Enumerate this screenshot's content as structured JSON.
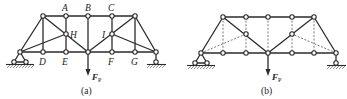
{
  "figures": [
    {
      "id": "a",
      "caption": "(a)",
      "load_label": "F",
      "load_subscript": "P",
      "joint_labels": {
        "A": "A",
        "B": "B",
        "C": "C",
        "D": "D",
        "E": "E",
        "F": "F",
        "G": "G",
        "H": "H",
        "I": "I"
      }
    },
    {
      "id": "b",
      "caption": "(b)",
      "load_label": "F",
      "load_subscript": "P"
    }
  ],
  "colors": {
    "member": "#2b2b2b",
    "dashed_member": "#555555",
    "background": "#ffffff"
  }
}
